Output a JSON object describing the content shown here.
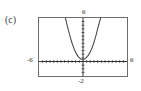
{
  "figure": {
    "panel_label": "(c)",
    "frame_color": "#6b6b72",
    "curve_color": "#4a4a4a",
    "axis_color": "#1a1a1a",
    "background": "#ffffff"
  },
  "labels": {
    "ymax": "6",
    "ymin": "-2",
    "xmin": "-6",
    "xmax": "6"
  },
  "chart_data": {
    "type": "line",
    "title": "(c)",
    "xlabel": "",
    "ylabel": "",
    "xlim": [
      -6,
      6
    ],
    "ylim": [
      -2,
      6
    ],
    "grid": false,
    "legend": "none",
    "axis_ticks": {
      "x_tick_step": 0.5,
      "y_tick_step": 0.5,
      "x_tick_labels": [
        "-6",
        "6"
      ],
      "y_tick_labels": [
        "6",
        "-2"
      ]
    },
    "annotations": [
      "upward-opening parabola with vertex just above the x-axis near the origin",
      "arms exit through the top edge of the viewing window"
    ],
    "series": [
      {
        "name": "parabola",
        "x": [
          -2.4,
          -2.1,
          -1.8,
          -1.5,
          -1.2,
          -0.9,
          -0.6,
          -0.3,
          -0.15,
          0,
          0.15,
          0.3,
          0.6,
          0.9,
          1.2,
          1.5,
          1.8,
          2.1,
          2.4
        ],
        "y": [
          6.0,
          4.75,
          3.6,
          2.55,
          1.7,
          1.05,
          0.6,
          0.35,
          0.3,
          0.3,
          0.32,
          0.4,
          0.7,
          1.15,
          1.8,
          2.65,
          3.7,
          4.9,
          6.0
        ]
      }
    ]
  }
}
